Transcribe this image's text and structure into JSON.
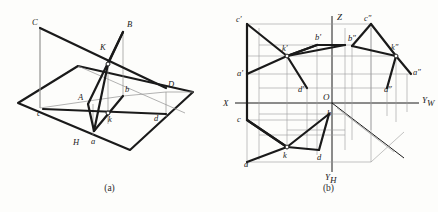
{
  "figure": {
    "type": "descriptive-geometry-drawing",
    "background_color": "#fdfdfb",
    "line_color": "#1a1a1a",
    "thin_line_color": "#8c8c8c"
  },
  "panel_a": {
    "caption": "(a)",
    "description": "Pictorial (axonometric) view: two intersecting triangular planes above a horizontal plane H with their projections",
    "labels": [
      {
        "id": "C",
        "text": "C",
        "x": 36,
        "y": 22,
        "case": "upper"
      },
      {
        "id": "B",
        "text": "B",
        "x": 129,
        "y": 24,
        "case": "upper"
      },
      {
        "id": "K",
        "text": "K",
        "x": 102,
        "y": 48,
        "case": "upper"
      },
      {
        "id": "A",
        "text": "A",
        "x": 81,
        "y": 97,
        "case": "upper"
      },
      {
        "id": "b",
        "text": "b",
        "x": 126,
        "y": 90,
        "case": "lower"
      },
      {
        "id": "D",
        "text": "D",
        "x": 169,
        "y": 85,
        "case": "upper"
      },
      {
        "id": "c",
        "text": "c",
        "x": 39,
        "y": 113,
        "case": "lower"
      },
      {
        "id": "k",
        "text": "k",
        "x": 110,
        "y": 119,
        "case": "lower"
      },
      {
        "id": "d",
        "text": "d",
        "x": 155,
        "y": 118,
        "case": "lower"
      },
      {
        "id": "H",
        "text": "H",
        "x": 76,
        "y": 142,
        "case": "upper"
      },
      {
        "id": "a",
        "text": "a",
        "x": 93,
        "y": 141,
        "case": "lower"
      }
    ]
  },
  "panel_b": {
    "caption": "(b)",
    "description": "Three-view orthographic projection with X, Yw, Yh and Z axes and origin O",
    "axes": [
      {
        "id": "X",
        "text": "X",
        "x": 7,
        "y": 107
      },
      {
        "id": "Z",
        "text": "Z",
        "x": 109,
        "y": 15
      },
      {
        "id": "O",
        "text": "O",
        "x": 113,
        "y": 101
      },
      {
        "id": "Yw",
        "text": "Y",
        "sub": "W",
        "x": 203,
        "y": 106
      },
      {
        "id": "Yh",
        "text": "Y",
        "sub": "H",
        "x": 109,
        "y": 176
      }
    ],
    "labels": [
      {
        "id": "c_p",
        "text": "c",
        "prime": "′",
        "x": 20,
        "y": 24
      },
      {
        "id": "c_pp",
        "text": "c",
        "prime": "″",
        "x": 146,
        "y": 23
      },
      {
        "id": "b_p",
        "text": "b",
        "prime": "′",
        "x": 106,
        "y": 42
      },
      {
        "id": "b_pp",
        "text": "b",
        "prime": "″",
        "x": 134,
        "y": 43
      },
      {
        "id": "k_p",
        "text": "k",
        "prime": "′",
        "x": 61,
        "y": 53
      },
      {
        "id": "k_pp",
        "text": "k",
        "prime": "″",
        "x": 170,
        "y": 52
      },
      {
        "id": "a_p",
        "text": "a",
        "prime": "′",
        "x": 21,
        "y": 74
      },
      {
        "id": "a_pp",
        "text": "a",
        "prime": "″",
        "x": 193,
        "y": 73
      },
      {
        "id": "d_p",
        "text": "d",
        "prime": "′",
        "x": 81,
        "y": 90
      },
      {
        "id": "d_pp",
        "text": "d",
        "prime": "″",
        "x": 170,
        "y": 90
      },
      {
        "id": "c_h",
        "text": "c",
        "prime": "",
        "x": 21,
        "y": 120
      },
      {
        "id": "b_h",
        "text": "b",
        "prime": "",
        "x": 106,
        "y": 114
      },
      {
        "id": "k_h",
        "text": "k",
        "prime": "",
        "x": 64,
        "y": 145
      },
      {
        "id": "d_h",
        "text": "d",
        "prime": "",
        "x": 98,
        "y": 150
      },
      {
        "id": "a_h",
        "text": "a",
        "prime": "",
        "x": 27,
        "y": 163
      }
    ]
  }
}
